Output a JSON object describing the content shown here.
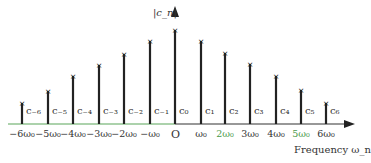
{
  "diagram": {
    "y_axis_label": "|c_n|",
    "origin_label": "O",
    "x_axis_label": "Frequency ω_n",
    "colors": {
      "axis_left": "#5aa55a",
      "axis_right": "#333333",
      "spike": "#222222",
      "tick_text_neg": "#333333",
      "tick_text_pos_green": "#4a9a4a"
    },
    "spikes": [
      {
        "n": -6,
        "coef": "c₋₆",
        "tick": "−6ω₀",
        "x": 22,
        "top": 103
      },
      {
        "n": -5,
        "coef": "c₋₅",
        "tick": "−5ω₀",
        "x": 48,
        "top": 91
      },
      {
        "n": -4,
        "coef": "c₋₄",
        "tick": "−4ω₀",
        "x": 73,
        "top": 76
      },
      {
        "n": -3,
        "coef": "c₋₃",
        "tick": "−3ω₀",
        "x": 99,
        "top": 65
      },
      {
        "n": -2,
        "coef": "c₋₂",
        "tick": "−2ω₀",
        "x": 124,
        "top": 54
      },
      {
        "n": -1,
        "coef": "c₋₁",
        "tick": "−ω₀",
        "x": 150,
        "top": 41
      },
      {
        "n": 0,
        "coef": "c₀",
        "tick": "",
        "x": 175,
        "top": 30
      },
      {
        "n": 1,
        "coef": "c₁",
        "tick": "ω₀",
        "x": 201,
        "top": 41
      },
      {
        "n": 2,
        "coef": "c₂",
        "tick": "2ω₀",
        "x": 225,
        "top": 53
      },
      {
        "n": 3,
        "coef": "c₃",
        "tick": "3ω₀",
        "x": 250,
        "top": 64
      },
      {
        "n": 4,
        "coef": "c₄",
        "tick": "4ω₀",
        "x": 276,
        "top": 76
      },
      {
        "n": 5,
        "coef": "c₅",
        "tick": "5ω₀",
        "x": 301,
        "top": 90
      },
      {
        "n": 6,
        "coef": "c₆",
        "tick": "6ω₀",
        "x": 326,
        "top": 103
      }
    ]
  }
}
